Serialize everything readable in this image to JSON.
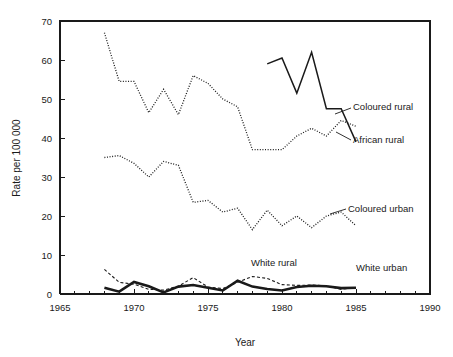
{
  "chart_data": {
    "type": "line",
    "title": "",
    "xlabel": "Year",
    "ylabel": "Rate per 100 000",
    "xlim": [
      1965,
      1990
    ],
    "ylim": [
      0,
      70
    ],
    "xticks": [
      1965,
      1970,
      1975,
      1980,
      1985,
      1990
    ],
    "yticks": [
      0,
      10,
      20,
      30,
      40,
      50,
      60,
      70
    ],
    "minor_x_tick_step": 1,
    "grid": false,
    "legend_position": "inline-annotations",
    "series": [
      {
        "name": "Coloured rural",
        "style": "dotted",
        "color": "#1a1a1a",
        "x": [
          1968,
          1969,
          1970,
          1971,
          1972,
          1973,
          1974,
          1975,
          1976,
          1977,
          1978,
          1979,
          1980,
          1981,
          1982,
          1983,
          1984,
          1985
        ],
        "values": [
          67.0,
          54.5,
          54.5,
          46.5,
          52.5,
          46.0,
          56.0,
          54.0,
          50.0,
          48.0,
          37.0,
          37.0,
          37.0,
          40.5,
          42.5,
          40.5,
          44.5,
          43.0
        ]
      },
      {
        "name": "African rural",
        "style": "solid",
        "color": "#1a1a1a",
        "x": [
          1979,
          1980,
          1981,
          1982,
          1983,
          1984,
          1985
        ],
        "values": [
          59.0,
          60.5,
          51.5,
          62.0,
          47.5,
          47.5,
          39.0
        ]
      },
      {
        "name": "Coloured urban",
        "style": "dotted",
        "color": "#1a1a1a",
        "x": [
          1968,
          1969,
          1970,
          1971,
          1972,
          1973,
          1974,
          1975,
          1976,
          1977,
          1978,
          1979,
          1980,
          1981,
          1982,
          1983,
          1984,
          1985
        ],
        "values": [
          35.0,
          35.5,
          33.5,
          30.0,
          34.0,
          33.0,
          23.5,
          24.0,
          21.0,
          22.0,
          16.5,
          21.5,
          17.5,
          20.0,
          17.0,
          20.0,
          21.0,
          17.5
        ]
      },
      {
        "name": "White rural",
        "style": "dashed",
        "color": "#1a1a1a",
        "x": [
          1968,
          1969,
          1970,
          1971,
          1972,
          1973,
          1974,
          1975,
          1976,
          1977,
          1978,
          1979,
          1980,
          1981,
          1982,
          1983,
          1984,
          1985
        ],
        "values": [
          6.3,
          3.0,
          2.5,
          1.2,
          1.0,
          2.0,
          4.2,
          1.8,
          1.4,
          3.0,
          4.5,
          4.0,
          2.4,
          2.2,
          2.3,
          2.1,
          1.2,
          1.6
        ]
      },
      {
        "name": "White urban",
        "style": "solid-bold",
        "color": "#1a1a1a",
        "x": [
          1968,
          1969,
          1970,
          1971,
          1972,
          1973,
          1974,
          1975,
          1976,
          1977,
          1978,
          1979,
          1980,
          1981,
          1982,
          1983,
          1984,
          1985
        ],
        "values": [
          1.6,
          0.6,
          3.1,
          2.0,
          0.4,
          1.9,
          2.3,
          1.6,
          0.9,
          3.4,
          1.9,
          1.3,
          0.9,
          1.8,
          2.1,
          2.0,
          1.5,
          1.6
        ]
      }
    ],
    "annotations": [
      {
        "text": "Coloured rural",
        "x": 353,
        "y": 110,
        "leader": "M 351,108 L 335,114"
      },
      {
        "text": "African rural",
        "x": 353,
        "y": 143,
        "leader": "M 351,140 L 336,132"
      },
      {
        "text": "Coloured urban",
        "x": 348,
        "y": 212,
        "leader": "M 346,209 L 330,214"
      },
      {
        "text": "White rural",
        "x": 251,
        "y": 266,
        "leader": ""
      },
      {
        "text": "White urban",
        "x": 356,
        "y": 271,
        "leader": ""
      }
    ]
  },
  "geometry": {
    "plot_left": 60,
    "plot_right": 430,
    "plot_top": 21,
    "plot_bottom": 294,
    "tick_len": 5,
    "minor_tick_len": 3.5
  }
}
